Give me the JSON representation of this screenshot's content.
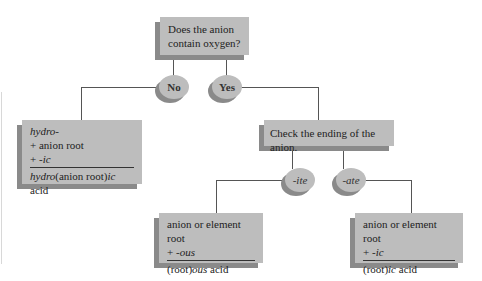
{
  "root": {
    "line1": "Does the anion",
    "line2": "contain oxygen?"
  },
  "branches": {
    "no": "No",
    "yes": "Yes",
    "ite": "-ite",
    "ate": "-ate"
  },
  "hydro_box": {
    "line1": "hydro-",
    "line2": "+ anion root",
    "line3_plus": "+ ",
    "line3_suffix": "-ic",
    "result_prefix": "hydro",
    "result_mid": "(anion root)",
    "result_suffix": "ic",
    "result_end": " acid"
  },
  "check_box": {
    "text": "Check the ending of the anion."
  },
  "ite_box": {
    "line1": "anion or element root",
    "line2_plus": "+ ",
    "line2_suffix": "-ous",
    "result_prefix": "(root)",
    "result_suffix": "ous",
    "result_end": " acid"
  },
  "ate_box": {
    "line1": "anion or element root",
    "line2_plus": "+ ",
    "line2_suffix": "-ic",
    "result_prefix": "(root)",
    "result_suffix": "ic",
    "result_end": " acid"
  }
}
